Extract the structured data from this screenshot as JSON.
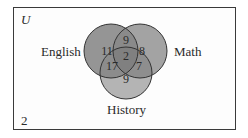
{
  "universe": {
    "label": "U",
    "outside_count": "2"
  },
  "sets": [
    {
      "name": "English",
      "color": "#8f8f8f"
    },
    {
      "name": "Math",
      "color": "#9a9a9a"
    },
    {
      "name": "History",
      "color": "#b0b0b0"
    }
  ],
  "regions": {
    "english_only": "11",
    "math_only": "8",
    "history_only": "9",
    "english_math_only": "9",
    "english_history_only": "17",
    "math_history_only": "7",
    "all_three": "2"
  }
}
